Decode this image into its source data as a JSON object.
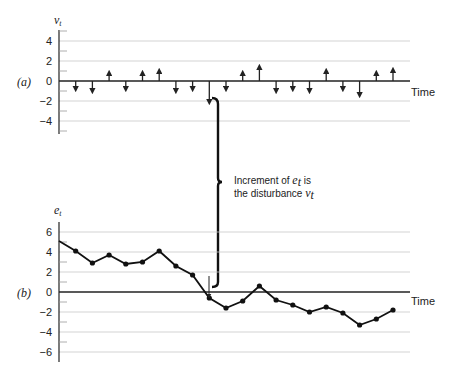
{
  "chart_data": [
    {
      "type": "bar",
      "panel_label": "(a)",
      "ylabel": "v_t",
      "xlabel": "Time",
      "yticks": [
        4,
        2,
        0,
        -2,
        -4
      ],
      "ylim": [
        -5,
        5
      ],
      "grid": true,
      "style": "arrows",
      "x": [
        1,
        2,
        3,
        4,
        5,
        6,
        7,
        8,
        9,
        10,
        11,
        12,
        13,
        14,
        15,
        16,
        17,
        18,
        19,
        20
      ],
      "values": [
        -1,
        -1.2,
        1,
        -1,
        1,
        1.2,
        -1.2,
        -1,
        -2.3,
        -1,
        1,
        1.6,
        -1.2,
        -1,
        -1.2,
        1.2,
        -1,
        -1.6,
        1,
        1.3
      ]
    },
    {
      "type": "line",
      "panel_label": "(b)",
      "ylabel": "e_t",
      "xlabel": "Time",
      "yticks": [
        6,
        4,
        2,
        0,
        -2,
        -4,
        -6
      ],
      "ylim": [
        -7,
        7
      ],
      "grid": true,
      "markers": true,
      "x": [
        0,
        1,
        2,
        3,
        4,
        5,
        6,
        7,
        8,
        9,
        10,
        11,
        12,
        13,
        14,
        15,
        16,
        17,
        18,
        19,
        20
      ],
      "values": [
        5.1,
        4.1,
        2.9,
        3.7,
        2.8,
        3.0,
        4.1,
        2.6,
        1.7,
        -0.6,
        -1.6,
        -0.9,
        0.6,
        -0.8,
        -1.3,
        -2.0,
        -1.5,
        -2.1,
        -3.3,
        -2.7,
        -1.8
      ]
    }
  ],
  "labels": {
    "panel_a": "(a)",
    "panel_b": "(b)",
    "v_axis": "v",
    "v_sub": "t",
    "e_axis": "e",
    "e_sub": "t",
    "time_a": "Time",
    "time_b": "Time",
    "annotation_line1_pre": "Increment of ",
    "annotation_line1_var": "e",
    "annotation_line1_sub": "t",
    "annotation_line1_post": " is",
    "annotation_line2_pre": "the disturbance ",
    "annotation_line2_var": "v",
    "annotation_line2_sub": "t"
  },
  "ticks_a": [
    "4",
    "2",
    "0",
    "−2",
    "−4"
  ],
  "ticks_b": [
    "6",
    "4",
    "2",
    "0",
    "−2",
    "−4",
    "−6"
  ]
}
